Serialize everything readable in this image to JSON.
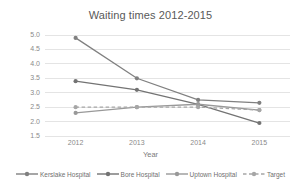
{
  "chart_data": {
    "type": "line",
    "title": "Waiting times 2012-2015",
    "xlabel": "Year",
    "ylabel": "Number of hours",
    "categories": [
      "2012",
      "2013",
      "2014",
      "2015"
    ],
    "ylim": [
      1.5,
      5.0
    ],
    "ytick_step": 0.5,
    "ytick_labels": [
      "5.0",
      "4.5",
      "4.0",
      "3.5",
      "3.0",
      "2.5",
      "2.0",
      "1.5"
    ],
    "grid": true,
    "legend_position": "bottom",
    "series": [
      {
        "name": "Kerslake Hospital",
        "values": [
          4.9,
          3.5,
          2.75,
          2.65
        ],
        "color": "#808080",
        "style": "solid",
        "marker": "circle"
      },
      {
        "name": "Bore Hospital",
        "values": [
          3.4,
          3.1,
          2.6,
          1.95
        ],
        "color": "#737373",
        "style": "solid",
        "marker": "circle"
      },
      {
        "name": "Uptown Hospital",
        "values": [
          2.3,
          2.5,
          2.6,
          2.4
        ],
        "color": "#999999",
        "style": "solid",
        "marker": "circle"
      },
      {
        "name": "Target",
        "values": [
          2.5,
          2.5,
          2.5,
          2.4
        ],
        "color": "#a6a6a6",
        "style": "dashed",
        "marker": "circle"
      }
    ]
  },
  "colors": {
    "gridline": "#e4e4e4",
    "text": "#595959",
    "tick_text": "#8a8a8a",
    "background": "#ffffff"
  }
}
